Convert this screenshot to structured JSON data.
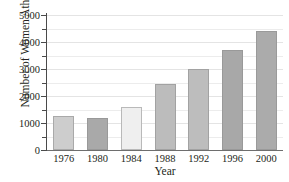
{
  "chart_data": {
    "type": "bar",
    "title": "",
    "xlabel": "Year",
    "ylabel": "Number of Women Athletes",
    "categories": [
      "1976",
      "1980",
      "1984",
      "1988",
      "1992",
      "1996",
      "2000"
    ],
    "values": [
      1250,
      1200,
      1600,
      2450,
      3000,
      3700,
      4400
    ],
    "ylim": [
      0,
      5000
    ],
    "ytick_labels": [
      "0",
      "1000",
      "2000",
      "3000",
      "4000",
      "5000"
    ],
    "ytick_values": [
      0,
      1000,
      2000,
      3000,
      4000,
      5000
    ],
    "minor_tick_values": [
      500,
      1500,
      2500,
      3500,
      4500
    ],
    "grid": true,
    "legend": "none",
    "bar_colors": [
      "#cdcdcd",
      "#a9a9a9",
      "#efefef",
      "#bcbcbc",
      "#bdbdbd",
      "#a8a8a8",
      "#ababab"
    ],
    "axis_color": "#4a4a4a",
    "grid_color": "#ececec"
  },
  "axes": {
    "y_title": "Number of Women Athletes",
    "x_title": "Year"
  }
}
